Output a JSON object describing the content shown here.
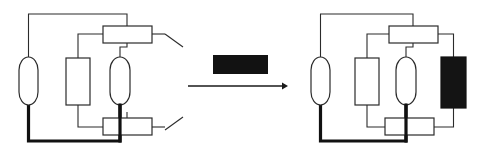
{
  "figure": {
    "title": "",
    "background_color": "#ffffff",
    "line_color": "#2b2b2b",
    "thick_line_color": "#111111",
    "fill_black": "#121212",
    "width": 478,
    "height": 163
  },
  "left_diagram": {
    "name": "circuit-before",
    "label": "",
    "components": [
      {
        "id": "left-oval",
        "shape": "stadium",
        "fill": "white",
        "x": 19,
        "y": 57,
        "w": 19,
        "h": 48
      },
      {
        "id": "middle-rect",
        "shape": "rect",
        "fill": "white",
        "x": 66,
        "y": 58,
        "w": 24,
        "h": 47
      },
      {
        "id": "right-oval",
        "shape": "stadium",
        "fill": "white",
        "x": 110,
        "y": 57,
        "w": 20,
        "h": 48
      },
      {
        "id": "top-rect",
        "shape": "rect",
        "fill": "white",
        "x": 103,
        "y": 26,
        "w": 49,
        "h": 17
      },
      {
        "id": "bottom-rect",
        "shape": "rect",
        "fill": "white",
        "x": 103,
        "y": 118,
        "w": 49,
        "h": 17
      }
    ],
    "switches": [
      {
        "id": "top-switch",
        "from_x": 165,
        "from_y": 34,
        "to_x": 183,
        "to_y": 47
      },
      {
        "id": "bottom-switch",
        "from_x": 165,
        "from_y": 130,
        "to_x": 183,
        "to_y": 117
      }
    ]
  },
  "transition": {
    "name": "transition-arrow",
    "redacted_box": {
      "x": 213,
      "y": 55,
      "w": 55,
      "h": 19,
      "color": "#121212",
      "label": ""
    },
    "arrow": {
      "x1": 188,
      "y1": 86,
      "x2": 288,
      "y2": 86,
      "direction": "right"
    }
  },
  "right_diagram": {
    "name": "circuit-after",
    "label": "",
    "components": [
      {
        "id": "left-oval",
        "shape": "stadium",
        "fill": "white",
        "x": 311,
        "y": 57,
        "w": 19,
        "h": 48
      },
      {
        "id": "middle-rect",
        "shape": "rect",
        "fill": "white",
        "x": 355,
        "y": 58,
        "w": 24,
        "h": 47
      },
      {
        "id": "right-oval",
        "shape": "stadium",
        "fill": "white",
        "x": 396,
        "y": 57,
        "w": 20,
        "h": 48
      },
      {
        "id": "top-rect",
        "shape": "rect",
        "fill": "white",
        "x": 389,
        "y": 26,
        "w": 49,
        "h": 17
      },
      {
        "id": "bottom-rect",
        "shape": "rect",
        "fill": "white",
        "x": 385,
        "y": 118,
        "w": 49,
        "h": 17
      },
      {
        "id": "black-rect",
        "shape": "rect",
        "fill": "black",
        "x": 441,
        "y": 57,
        "w": 25,
        "h": 51
      }
    ],
    "switches": []
  }
}
